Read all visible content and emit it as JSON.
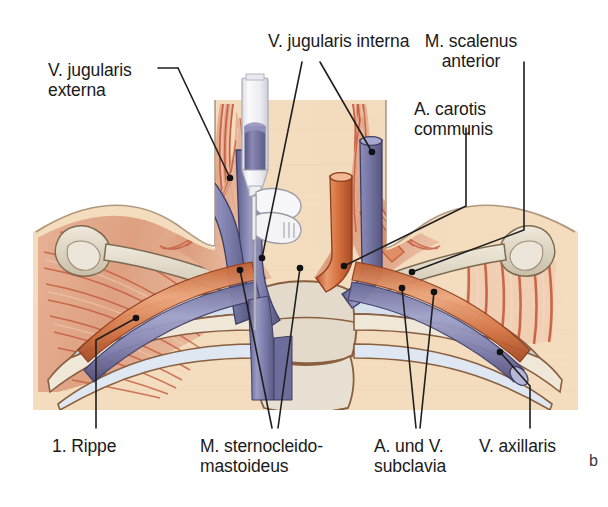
{
  "figure": {
    "panel_letter": "b",
    "caption_language": "de",
    "background_color": "#f3ddbe",
    "skin_color": "#f6e3c8",
    "muscle_color": "#e0a183",
    "muscle_stripe_color": "#c4563a",
    "artery_color": "#d4713f",
    "vein_color": "#7b7bab",
    "bone_color": "#ded6c4",
    "cartilage_color": "#ccd8e6",
    "leader_line_color": "#1f1f1f",
    "syringe_color": "#f2f2f4",
    "blood_color": "#6f6f9c"
  },
  "labels": [
    {
      "id": "v-jugularis-externa",
      "lines": [
        "V. jugularis",
        "externa"
      ],
      "text": "V. jugularis externa",
      "align": "left",
      "x": 48,
      "y": 62
    },
    {
      "id": "v-jugularis-interna",
      "lines": [
        "V. jugularis interna"
      ],
      "text": "V. jugularis interna",
      "align": "left",
      "x": 268,
      "y": 32
    },
    {
      "id": "m-scalenus-anterior",
      "lines": [
        "M. scalenus",
        "anterior"
      ],
      "text": "M. scalenus anterior",
      "align": "center",
      "x": 471,
      "y": 32
    },
    {
      "id": "a-carotis-communis",
      "lines": [
        "A. carotis",
        "communis"
      ],
      "text": "A. carotis communis",
      "align": "left",
      "x": 414,
      "y": 100
    },
    {
      "id": "erste-rippe",
      "lines": [
        "1. Rippe"
      ],
      "text": "1. Rippe",
      "align": "left",
      "x": 52,
      "y": 437
    },
    {
      "id": "m-sternocleidomastoideus",
      "lines": [
        "M. sternocleido-",
        "mastoideus"
      ],
      "text": "M. sternocleidomastoideus",
      "align": "left",
      "x": 200,
      "y": 437
    },
    {
      "id": "a-und-v-subclavia",
      "lines": [
        "A. und V.",
        "subclavia"
      ],
      "text": "A. und V. subclavia",
      "align": "left",
      "x": 374,
      "y": 437
    },
    {
      "id": "v-axillaris",
      "lines": [
        "V. axillaris"
      ],
      "text": "V. axillaris",
      "align": "left",
      "x": 479,
      "y": 437
    }
  ],
  "structures": [
    {
      "id": "v-jugularis-externa",
      "name": "V. jugularis externa",
      "type": "vein"
    },
    {
      "id": "v-jugularis-interna",
      "name": "V. jugularis interna",
      "type": "vein"
    },
    {
      "id": "m-scalenus-anterior",
      "name": "M. scalenus anterior",
      "type": "muscle"
    },
    {
      "id": "a-carotis-communis",
      "name": "A. carotis communis",
      "type": "artery"
    },
    {
      "id": "erste-rippe",
      "name": "1. Rippe",
      "type": "bone"
    },
    {
      "id": "m-sternocleidomastoideus",
      "name": "M. sternocleidomastoideus",
      "type": "muscle"
    },
    {
      "id": "a-und-v-subclavia",
      "name": "A. und V. subclavia",
      "type": "vessel"
    },
    {
      "id": "v-axillaris",
      "name": "V. axillaris",
      "type": "vein"
    }
  ]
}
